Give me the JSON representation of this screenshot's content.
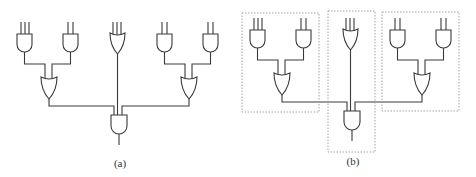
{
  "figure": {
    "panels": [
      {
        "id": "a",
        "caption": "(a)",
        "caption_pos": [
          120,
          157
        ],
        "offset": [
          0,
          0
        ],
        "modules": []
      },
      {
        "id": "b",
        "caption": "(b)",
        "caption_pos": [
          353,
          155
        ],
        "offset": [
          233,
          -4
        ],
        "modules": [
          {
            "name": "left-module-box",
            "rect": [
              242,
              13,
              77,
              99
            ]
          },
          {
            "name": "center-module-box",
            "rect": [
              328,
              11,
              47,
              141
            ]
          },
          {
            "name": "right-module-box",
            "rect": [
              382,
              12,
              77,
              99
            ]
          }
        ]
      }
    ],
    "circuit": {
      "gates": [
        {
          "name": "and-gate-left-1",
          "type": "AND",
          "x": 17,
          "y": 34,
          "w": 15,
          "h": 18,
          "inputs": [
            21,
            25,
            29
          ]
        },
        {
          "name": "and-gate-left-2",
          "type": "AND",
          "x": 63,
          "y": 34,
          "w": 15,
          "h": 18,
          "inputs": [
            68,
            73
          ]
        },
        {
          "name": "or-gate-center",
          "type": "OR",
          "x": 110,
          "y": 33,
          "w": 15,
          "h": 21,
          "inputs": [
            113,
            117,
            121
          ]
        },
        {
          "name": "and-gate-right-1",
          "type": "AND",
          "x": 157,
          "y": 34,
          "w": 15,
          "h": 18,
          "inputs": [
            162,
            167
          ]
        },
        {
          "name": "and-gate-right-2",
          "type": "AND",
          "x": 203,
          "y": 34,
          "w": 15,
          "h": 18,
          "inputs": [
            208,
            213
          ]
        },
        {
          "name": "or-gate-left",
          "type": "OR",
          "x": 41,
          "y": 77,
          "w": 16,
          "h": 22,
          "inputs": [
            45,
            52
          ]
        },
        {
          "name": "or-gate-right",
          "type": "OR",
          "x": 181,
          "y": 77,
          "w": 16,
          "h": 22,
          "inputs": [
            185,
            192
          ]
        },
        {
          "name": "and-gate-output",
          "type": "AND",
          "x": 111,
          "y": 115,
          "w": 16,
          "h": 19,
          "inputs": [
            114,
            118,
            122
          ]
        }
      ],
      "input_top_y": 22,
      "wires": [
        [
          [
            24.5,
            52
          ],
          [
            24.5,
            64
          ],
          [
            45,
            64
          ],
          [
            45,
            78
          ]
        ],
        [
          [
            70.5,
            52
          ],
          [
            70.5,
            64
          ],
          [
            52,
            64
          ],
          [
            52,
            78
          ]
        ],
        [
          [
            164.5,
            52
          ],
          [
            164.5,
            64
          ],
          [
            185,
            64
          ],
          [
            185,
            78
          ]
        ],
        [
          [
            210.5,
            52
          ],
          [
            210.5,
            64
          ],
          [
            192,
            64
          ],
          [
            192,
            78
          ]
        ],
        [
          [
            49,
            99
          ],
          [
            49,
            106
          ],
          [
            114,
            106
          ],
          [
            114,
            116
          ]
        ],
        [
          [
            189,
            99
          ],
          [
            189,
            106
          ],
          [
            122,
            106
          ],
          [
            122,
            116
          ]
        ],
        [
          [
            117.5,
            54
          ],
          [
            117.5,
            116
          ]
        ],
        [
          [
            119,
            134
          ],
          [
            119,
            145
          ]
        ]
      ]
    }
  }
}
